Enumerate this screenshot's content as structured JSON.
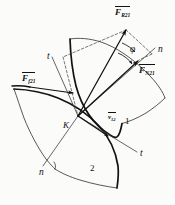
{
  "figure": {
    "background_color": "#fbfbfa",
    "ink_color": "#111111",
    "labels": {
      "resultant_force": {
        "symbol": "F",
        "subscript": "R21",
        "x": 115,
        "y": 8
      },
      "normal_force": {
        "symbol": "F",
        "subscript": "N21",
        "x": 139,
        "y": 66
      },
      "friction_force": {
        "symbol": "F",
        "subscript": "f21",
        "x": 22,
        "y": 74
      },
      "friction_angle": {
        "symbol": "φ",
        "x": 130,
        "y": 45
      },
      "normal_axis_upper": {
        "symbol": "n",
        "x": 158,
        "y": 45
      },
      "normal_axis_lower": {
        "symbol": "n",
        "x": 39,
        "y": 168
      },
      "tangent_axis_upper": {
        "symbol": "t",
        "x": 47,
        "y": 52
      },
      "tangent_axis_lower": {
        "symbol": "t",
        "x": 140,
        "y": 149
      },
      "contact_point": {
        "symbol": "K",
        "x": 63,
        "y": 121
      },
      "relative_velocity": {
        "symbol": "v",
        "subscript": "12",
        "x": 108,
        "y": 114
      },
      "body_one": {
        "symbol": "1",
        "x": 125,
        "y": 117
      },
      "body_two": {
        "symbol": "2",
        "x": 90,
        "y": 164
      }
    },
    "geometry": {
      "contact_point_px": [
        78,
        116
      ],
      "resultant_arrow_tip_px": [
        126,
        30
      ],
      "normal_arrow_tip_px": [
        139,
        60
      ],
      "friction_arrow_tip_px": [
        74,
        92
      ],
      "velocity_arrow_tip_px": [
        109,
        137
      ]
    }
  }
}
